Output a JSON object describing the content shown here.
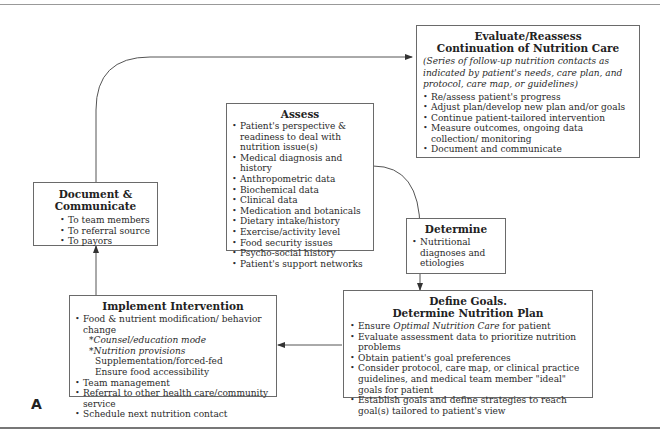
{
  "figure_label": "A",
  "boxes": {
    "evaluate": {
      "title_line1": "Evaluate/Reassess",
      "title_line2": "Continuation of Nutrition Care",
      "subtitle": "(Series of follow-up nutrition contacts as indicated by patient's needs, care plan, and protocol, care map, or guidelines)",
      "items": [
        "Re/assess patient's progress",
        "Adjust plan/develop new plan and/or goals",
        "Continue patient-tailored intervention",
        "Measure outcomes, ongoing data collection/ monitoring",
        "Document and communicate"
      ]
    },
    "assess": {
      "title": "Assess",
      "items": [
        "Patient's perspective & readiness to deal with nutrition issue(s)",
        "Medical diagnosis and history",
        "Anthropometric data",
        "Biochemical data",
        "Clinical data",
        "Medication and botanicals",
        "Dietary intake/history",
        "Exercise/activity level",
        "Food security issues",
        "Psycho-social history",
        "Patient's support networks"
      ]
    },
    "document": {
      "title": "Document & Communicate",
      "items": [
        "To team members",
        "To referral source",
        "To payors"
      ]
    },
    "determine": {
      "title": "Determine",
      "items": [
        "Nutritional diagnoses and etiologies"
      ]
    },
    "define_goals": {
      "title_line1": "Define Goals.",
      "title_line2": "Determine Nutrition Plan",
      "items": [
        {
          "pre": "Ensure ",
          "em": "Optimal Nutrition Care",
          "post": " for patient"
        },
        {
          "pre": "Evaluate assessment data to prioritize nutrition problems",
          "em": "",
          "post": ""
        },
        {
          "pre": "Obtain patient's goal preferences",
          "em": "",
          "post": ""
        },
        {
          "pre": "Consider protocol, care map, or clinical practice guidelines, and medical team member \"ideal\" goals for patient",
          "em": "",
          "post": ""
        },
        {
          "pre": "Establish goals and define strategies to reach goal(s) tailored to patient's view",
          "em": "",
          "post": ""
        }
      ]
    },
    "implement": {
      "title": "Implement Intervention",
      "items": [
        {
          "text": "Food & nutrient modification/ behavior change",
          "level": 0,
          "bullet": true,
          "italic": false
        },
        {
          "text": "*Counsel/education mode",
          "level": 1,
          "bullet": false,
          "italic": true
        },
        {
          "text": "*Nutrition provisions",
          "level": 1,
          "bullet": false,
          "italic": true
        },
        {
          "text": "Supplementation/forced-fed",
          "level": 2,
          "bullet": false,
          "italic": false
        },
        {
          "text": "Ensure food accessibility",
          "level": 2,
          "bullet": false,
          "italic": false
        },
        {
          "text": "Team management",
          "level": 0,
          "bullet": true,
          "italic": false
        },
        {
          "text": "Referral to other health care/community service",
          "level": 0,
          "bullet": true,
          "italic": false
        },
        {
          "text": "Schedule next nutrition contact",
          "level": 0,
          "bullet": true,
          "italic": false
        }
      ]
    }
  },
  "connectors": [
    {
      "from": "document",
      "to": "evaluate",
      "type": "arrow"
    },
    {
      "from": "assess",
      "to": "determine",
      "type": "curved-arrow"
    },
    {
      "from": "determine",
      "to": "define_goals",
      "type": "arrow"
    },
    {
      "from": "define_goals",
      "to": "implement",
      "type": "arrow"
    },
    {
      "from": "implement",
      "to": "document",
      "type": "arrow"
    }
  ],
  "colors": {
    "line": "#555555",
    "border": "#6a6a6a",
    "text": "#2a2a2a"
  }
}
